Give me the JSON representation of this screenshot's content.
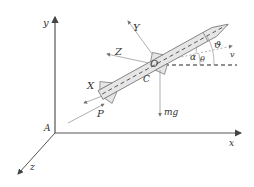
{
  "diagram": {
    "colors": {
      "axis": "#555555",
      "thin": "#999999",
      "rocket_fill": "#e6e6e6",
      "rocket_stroke": "#777777",
      "dashed": "#222222",
      "text": "#333333"
    },
    "ground_frame": {
      "origin_label": "A",
      "x_label": "x",
      "y_label": "y",
      "z_label": "z"
    },
    "body_frame": {
      "origin_label": "O",
      "center_label": "C",
      "X_label": "X",
      "Y_label": "Y",
      "Z_label": "Z"
    },
    "forces": {
      "thrust_label": "P",
      "gravity_label": "mg",
      "velocity_label": "v"
    },
    "angles": {
      "attack": "α",
      "trajectory": "θ",
      "pitch": "ϑ"
    }
  }
}
